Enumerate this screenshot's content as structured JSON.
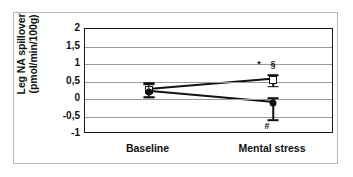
{
  "chart_data": {
    "type": "line",
    "title": "",
    "subtitle": "",
    "xlabel": "",
    "ylabel": "Leg NA spillover (pmol/min/100g)",
    "ylabel_lines": [
      "Leg NA spillover",
      "(pmol/min/100g)"
    ],
    "categories": [
      "Baseline",
      "Mental stress"
    ],
    "x_tick_labels": [
      "Baseline",
      "Mental stress"
    ],
    "y_tick_labels": [
      "2",
      "1,5",
      "1",
      "0,5",
      "0",
      "-0,5",
      "-1"
    ],
    "y_tick_values": [
      2,
      1.5,
      1,
      0.5,
      0,
      -0.5,
      -1
    ],
    "ylim": [
      -1,
      2
    ],
    "xlim": [
      0,
      1
    ],
    "grid": true,
    "grid_axis": "y",
    "legend": false,
    "legend_position": "none",
    "series": [
      {
        "name": "open-square-series",
        "marker": "open-square",
        "values": [
          0.25,
          0.55
        ],
        "error_upper": [
          0.45,
          0.68
        ],
        "error_lower": [
          0.05,
          0.35
        ]
      },
      {
        "name": "filled-circle-series",
        "marker": "filled-circle",
        "values": [
          0.2,
          -0.12
        ],
        "error_upper": [
          0.42,
          0.02
        ],
        "error_lower": [
          0.04,
          -0.6
        ]
      }
    ],
    "annotations": [
      {
        "text": "*",
        "x": 1,
        "y": 1.0,
        "x_offset_px": -14,
        "name": "asterisk-annotation"
      },
      {
        "text": "§",
        "x": 1,
        "y": 1.0,
        "x_offset_px": 0,
        "name": "section-annotation"
      },
      {
        "text": "#",
        "x": 1,
        "y": -0.78,
        "x_offset_px": -6,
        "name": "hash-annotation"
      }
    ],
    "colors": {
      "axis": "#1a1a1a",
      "grid": "#9a9a9a",
      "marker": "#111111",
      "background": "#ffffff",
      "outer_frame": "#b9b9b9"
    }
  }
}
